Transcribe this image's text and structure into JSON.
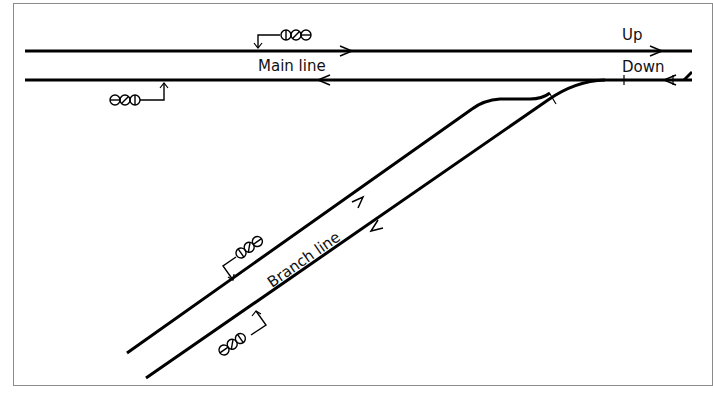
{
  "diagram": {
    "labels": {
      "main_line": "Main line",
      "branch_line": "Branch line",
      "up": "Up",
      "down": "Down"
    },
    "tracks": [
      {
        "id": "up-main",
        "direction": "right"
      },
      {
        "id": "down-main",
        "direction": "left"
      },
      {
        "id": "branch-up",
        "direction": "up-right"
      },
      {
        "id": "branch-down",
        "direction": "down-left"
      }
    ],
    "signals": [
      {
        "id": "main-up-signal",
        "symbol": "ΦØΘ"
      },
      {
        "id": "main-down-signal",
        "symbol": "ΘØΦ"
      },
      {
        "id": "branch-up-signal",
        "symbol": "ΦØΘ"
      },
      {
        "id": "branch-down-signal",
        "symbol": "ΘØΦ"
      }
    ],
    "colors": {
      "track": "#000000",
      "frame": "#8a8a8a",
      "background": "#ffffff"
    }
  }
}
